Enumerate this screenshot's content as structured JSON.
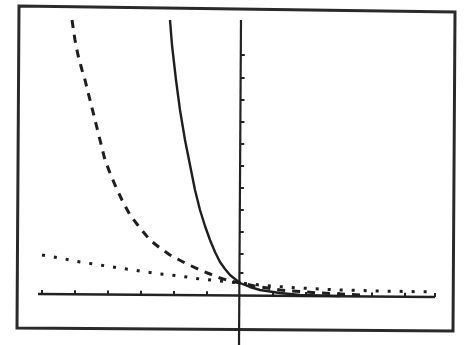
{
  "chart_data": {
    "type": "line",
    "title": "",
    "xlabel": "",
    "ylabel": "",
    "grid": false,
    "legend": null,
    "axes": {
      "x_axis_pixel_y": 295,
      "y_axis_pixel_x": 240,
      "x_ticks_pixel": [
        42,
        75,
        108,
        141,
        174,
        207,
        273,
        306,
        339,
        372,
        405,
        435
      ],
      "y_ticks_pixel": [
        55,
        78,
        100,
        122,
        144,
        166,
        188,
        210,
        232,
        254,
        273
      ]
    },
    "series": [
      {
        "name": "solid",
        "style": "solid",
        "points_px": [
          [
            170,
            20
          ],
          [
            172,
            45
          ],
          [
            176,
            80
          ],
          [
            180,
            110
          ],
          [
            185,
            140
          ],
          [
            190,
            165
          ],
          [
            195,
            190
          ],
          [
            200,
            210
          ],
          [
            205,
            226
          ],
          [
            210,
            240
          ],
          [
            215,
            252
          ],
          [
            220,
            262
          ],
          [
            225,
            269
          ],
          [
            230,
            275
          ],
          [
            235,
            279
          ],
          [
            240,
            283
          ],
          [
            250,
            287
          ],
          [
            260,
            290
          ],
          [
            280,
            293
          ],
          [
            300,
            295
          ],
          [
            340,
            296
          ]
        ]
      },
      {
        "name": "dashed",
        "style": "dashed",
        "points_px": [
          [
            72,
            20
          ],
          [
            75,
            40
          ],
          [
            78,
            55
          ],
          [
            82,
            70
          ],
          [
            85,
            80
          ],
          [
            90,
            100
          ],
          [
            95,
            120
          ],
          [
            100,
            140
          ],
          [
            105,
            160
          ],
          [
            110,
            173
          ],
          [
            115,
            185
          ],
          [
            122,
            200
          ],
          [
            130,
            215
          ],
          [
            140,
            228
          ],
          [
            150,
            240
          ],
          [
            160,
            248
          ],
          [
            170,
            255
          ],
          [
            185,
            263
          ],
          [
            200,
            270
          ],
          [
            210,
            274
          ],
          [
            220,
            278
          ],
          [
            230,
            281
          ],
          [
            240,
            283
          ],
          [
            260,
            287
          ],
          [
            280,
            290
          ],
          [
            320,
            293
          ],
          [
            360,
            295
          ]
        ]
      },
      {
        "name": "dotted",
        "style": "dotted",
        "points_px": [
          [
            42,
            255
          ],
          [
            60,
            258
          ],
          [
            80,
            262
          ],
          [
            100,
            265
          ],
          [
            120,
            268
          ],
          [
            140,
            271
          ],
          [
            160,
            274
          ],
          [
            180,
            276
          ],
          [
            200,
            279
          ],
          [
            220,
            281
          ],
          [
            240,
            283
          ],
          [
            270,
            286
          ],
          [
            300,
            288
          ],
          [
            340,
            290
          ],
          [
            380,
            291
          ],
          [
            435,
            292
          ]
        ]
      }
    ],
    "intersection": {
      "x": 0,
      "y": 1,
      "pixel": [
        240,
        283
      ]
    }
  },
  "frame": {
    "border_color": "#2a2a2a",
    "curve_color": "#1e1e1e",
    "background": "#ffffff"
  }
}
